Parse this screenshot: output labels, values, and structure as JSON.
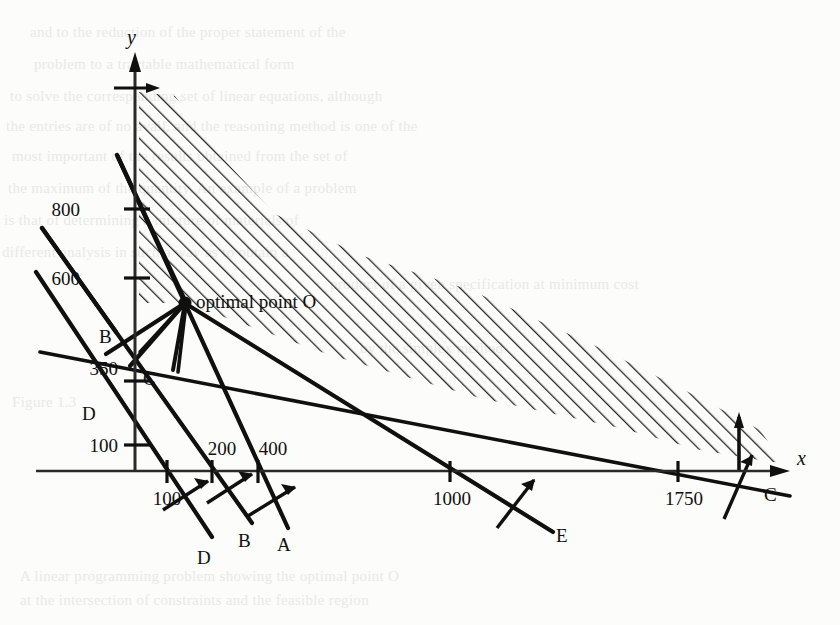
{
  "figure": {
    "axes": {
      "x_label": "x",
      "y_label": "y",
      "origin_px": [
        135,
        471
      ]
    },
    "optimal_point": {
      "label": "optimal point O",
      "px": [
        185,
        303
      ]
    },
    "y_ticks": [
      {
        "value": "800",
        "px_y": 209
      },
      {
        "value": "600",
        "px_y": 278
      },
      {
        "value": "350",
        "px_y": 368
      },
      {
        "value": "100",
        "px_y": 445
      }
    ],
    "x_ticks": [
      {
        "value": "100",
        "px_x": 167
      },
      {
        "value": "200",
        "px_x": 212
      },
      {
        "value": "400",
        "px_x": 258
      },
      {
        "value": "1000",
        "px_x": 450
      },
      {
        "value": "1750",
        "px_x": 678
      }
    ],
    "constraint_labels": [
      {
        "name": "A",
        "text": "A",
        "px": [
          284,
          543
        ]
      },
      {
        "name": "B-lower",
        "text": "B",
        "px": [
          245,
          540
        ]
      },
      {
        "name": "B-upper",
        "text": "B",
        "px": [
          104,
          335
        ]
      },
      {
        "name": "C-left",
        "text": "C",
        "px": [
          148,
          377
        ]
      },
      {
        "name": "C-right",
        "text": "C",
        "px": [
          770,
          494
        ]
      },
      {
        "name": "D-lower",
        "text": "D",
        "px": [
          204,
          556
        ]
      },
      {
        "name": "D-upper",
        "text": "D",
        "px": [
          88,
          412
        ]
      },
      {
        "name": "E",
        "text": "E",
        "px": [
          560,
          535
        ]
      }
    ],
    "region": {
      "shading": "hatched-45deg",
      "meaning": "feasible region"
    },
    "colors": {
      "ink": "#101010",
      "background": "#fcfcfb",
      "hatch": "#1a1a1a",
      "axis": "#2a2a2a",
      "showthrough": "#e9e9e7"
    },
    "background_lines": [
      "and to the reduction of the proper statement of the",
      "problem to a tractable mathematical form",
      "to solve the corresponding set of linear equations, although",
      "the entries are of no avail, and the reasoning method is one of the",
      "most important of the results obtained from the set of",
      "the maximum of the quantity. An example of a problem",
      "is that of determining a mixture of materials of",
      "different analysis in such a way as to obtain a",
      "product of a given specification at minimum cost",
      "by the simplex method",
      "Figure 1.3",
      "A linear programming problem showing the optimal point O",
      "at the intersection of constraints and the feasible region"
    ]
  }
}
